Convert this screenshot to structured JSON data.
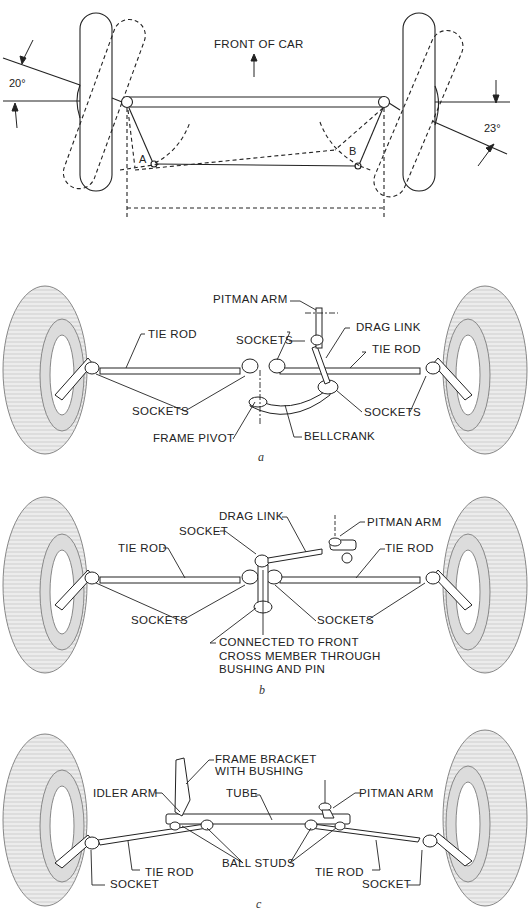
{
  "figure_top": {
    "title": "FRONT OF CAR",
    "left_angle": "20°",
    "right_angle": "23°",
    "point_a": "A",
    "point_b": "B"
  },
  "figure_a": {
    "caption": "a",
    "labels": {
      "pitman_arm": "PITMAN ARM",
      "drag_link": "DRAG LINK",
      "tie_rod_left": "TIE ROD",
      "tie_rod_right": "TIE ROD",
      "sockets_upper": "SOCKETS",
      "sockets_left": "SOCKETS",
      "sockets_right": "SOCKETS",
      "frame_pivot": "FRAME PIVOT",
      "bellcrank": "BELLCRANK"
    }
  },
  "figure_b": {
    "caption": "b",
    "labels": {
      "drag_link": "DRAG LINK",
      "pitman_arm": "PITMAN ARM",
      "socket": "SOCKET",
      "tie_rod_left": "TIE ROD",
      "tie_rod_right": "TIE ROD",
      "sockets_left": "SOCKETS",
      "sockets_right": "SOCKETS",
      "connected": "CONNECTED TO FRONT\nCROSS MEMBER THROUGH\nBUSHING AND PIN"
    }
  },
  "figure_c": {
    "caption": "c",
    "labels": {
      "frame_bracket": "FRAME BRACKET\nWITH BUSHING",
      "idler_arm": "IDLER ARM",
      "tube": "TUBE",
      "pitman_arm": "PITMAN ARM",
      "ball_studs": "BALL STUDS",
      "tie_rod_left": "TIE ROD",
      "tie_rod_right": "TIE ROD",
      "socket_left": "SOCKET",
      "socket_right": "SOCKET"
    }
  }
}
